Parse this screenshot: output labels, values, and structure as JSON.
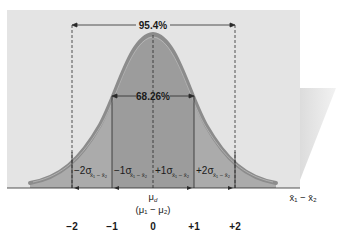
{
  "diagram": {
    "type": "normal-distribution-sampling-distribution-of-difference",
    "interval_labels": {
      "outer": "95.4%",
      "inner": "68.26%"
    },
    "band_labels": [
      {
        "sign": "−2σ",
        "subscript": "x̄₁ − x̄₂"
      },
      {
        "sign": "−1σ",
        "subscript": "x̄₁ − x̄₂"
      },
      {
        "sign": "+1σ",
        "subscript": "x̄₁ − x̄₂"
      },
      {
        "sign": "+2σ",
        "subscript": "x̄₁ − x̄₂"
      }
    ],
    "center_label": "μd",
    "center_label_main": "μ",
    "center_label_sub": "d",
    "center_sublabel": "(μ₁ − μ₂)",
    "axis_label": "x̄₁ − x̄₂",
    "z_ticks": [
      "−2",
      "−1",
      "0",
      "+1",
      "+2"
    ],
    "colors": {
      "panel": "#e4e4e4",
      "shadow": "#d6d6d6",
      "curve_fill": "#ababab",
      "center_band": "#9c9c9c",
      "curve_stroke": "#8c8c8c",
      "line": "#2a2a2a"
    }
  }
}
